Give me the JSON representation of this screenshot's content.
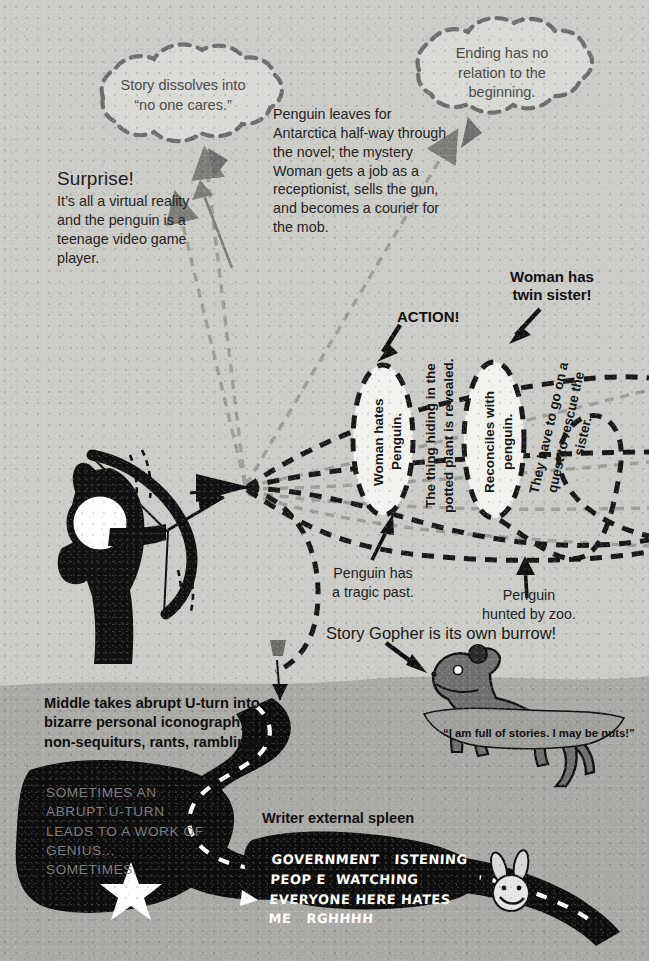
{
  "canvas": {
    "width": 649,
    "height": 961
  },
  "palette": {
    "sky": "#cbcbc7",
    "ground": "#a9a9a5",
    "ink": "#111111",
    "dashed_dark": "#1a1a1a",
    "dashed_light": "#9a9a96",
    "cloud_fill": "#d9d9d5",
    "cloud_stroke": "#6f6f6f",
    "gopher_body": "#6f6f6f",
    "text_dark": "#1e1e1e",
    "text_muted": "#4d4d4d",
    "dark_caption": "#7e7e7e",
    "white": "#ffffff"
  },
  "clouds": [
    {
      "name": "cloud-no-one-cares",
      "lines": [
        "Story dissolves into",
        "“no one cares.”"
      ]
    },
    {
      "name": "cloud-ending",
      "lines": [
        "Ending has no",
        "relation to the",
        "beginning."
      ]
    }
  ],
  "notes": {
    "surprise_title": "Surprise!",
    "surprise_body": "It’s all a virtual reality and the penguin is a teenage video game player.",
    "penguin_antarctica": "Penguin leaves for Antarctica half-way through the novel; the mystery Woman gets a job as a receptionist, sells the gun, and becomes a courier for the mob."
  },
  "bold_labels": {
    "action": "ACTION!",
    "twin_sister": "Woman has\ntwin sister!"
  },
  "ovals": [
    {
      "name": "oval-woman-hates-penguin",
      "text": "Woman hates Penguin."
    },
    {
      "name": "oval-reconciles",
      "text": "Reconciles with penguin."
    }
  ],
  "vertical_notes": [
    {
      "name": "note-potted-plant",
      "text": "The thing hiding in the potted plant is revealed."
    },
    {
      "name": "note-quest",
      "text": "They have to go on a quest to rescue the sister."
    }
  ],
  "captions": {
    "tragic_past": "Penguin has\na tragic past.",
    "hunted_by_zoo": "Penguin\nhunted by zoo.",
    "story_gopher": "Story Gopher is its own burrow!"
  },
  "ground": {
    "middle_uturn": "Middle takes abrupt U-turn into bizarre personal iconography, non-sequiturs, rants, ramblings.",
    "dark_caption": "SOMETIMES AN ABRUPT U-TURN LEADS TO A WORK OF GENIUS... SOMETIMES.",
    "spleen_label": "Writer external spleen"
  },
  "gopher": {
    "quote": "“I am full of stories. I may be nuts!”"
  },
  "rant": {
    "lines": [
      "GOVERNMENT   ISTENING",
      "PEOP E  WATCHING",
      "EVERYONE HERE HATES",
      "ME   RGHHHH"
    ]
  },
  "figures": {
    "archer": "archer-silhouette",
    "gopher": "gopher-figure",
    "bunny": "bunny-face",
    "star": "star-shape"
  }
}
